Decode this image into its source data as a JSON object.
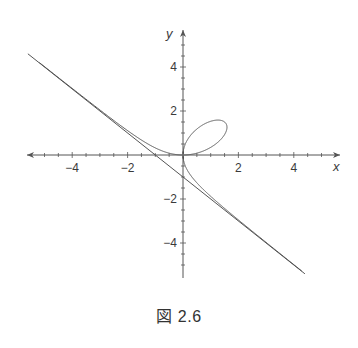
{
  "caption": "図 2.6",
  "chart_data": {
    "type": "line",
    "title": "",
    "caption": "図 2.6",
    "xlabel": "x",
    "ylabel": "y",
    "xlim": [
      -5.5,
      5.5
    ],
    "ylim": [
      -5.8,
      5.8
    ],
    "xticks": [
      -4,
      -2,
      2,
      4
    ],
    "yticks": [
      -4,
      -2,
      2,
      4
    ],
    "minor_tick_step": 0.5,
    "grid": false,
    "legend": null,
    "series": [
      {
        "name": "folium of Descartes",
        "equation": "x^3 + y^3 = 3xy",
        "parametric": "x = 3t/(1+t^3), y = 3t^2/(1+t^3)",
        "points": [
          [
            -5.6,
            4.22
          ],
          [
            -4,
            2.77
          ],
          [
            -3,
            1.82
          ],
          [
            -2,
            0.93
          ],
          [
            -1.5,
            0.55
          ],
          [
            -1,
            0.27
          ],
          [
            -0.5,
            0.07
          ],
          [
            0,
            0
          ],
          [
            0.5,
            1.37
          ],
          [
            1,
            1.56
          ],
          [
            1.5,
            1.5
          ],
          [
            1.5,
            1.5
          ],
          [
            1.56,
            1
          ],
          [
            1.37,
            0.5
          ],
          [
            0,
            0
          ],
          [
            0.07,
            -0.5
          ],
          [
            0.27,
            -1
          ],
          [
            0.55,
            -1.5
          ],
          [
            0.93,
            -2
          ],
          [
            1.82,
            -3
          ],
          [
            2.77,
            -4
          ],
          [
            4.22,
            -5.6
          ]
        ],
        "loop_max": [
          1.59,
          1.26
        ]
      },
      {
        "name": "asymptote",
        "equation": "x + y + 1 = 0",
        "x_intercept": -1,
        "y_intercept": -1,
        "points": [
          [
            -5.6,
            4.6
          ],
          [
            4.4,
            -5.4
          ]
        ]
      }
    ]
  },
  "axes": {
    "origin_px": [
      183,
      155
    ],
    "px_per_unit_x": 27.7,
    "px_per_unit_y": 22,
    "x_axis_px": [
      27,
      340
    ],
    "y_axis_px": [
      30,
      278
    ],
    "x_label": "x",
    "y_label": "y"
  },
  "colors": {
    "curve": "#555555",
    "axis": "#555555",
    "text": "#333333"
  }
}
